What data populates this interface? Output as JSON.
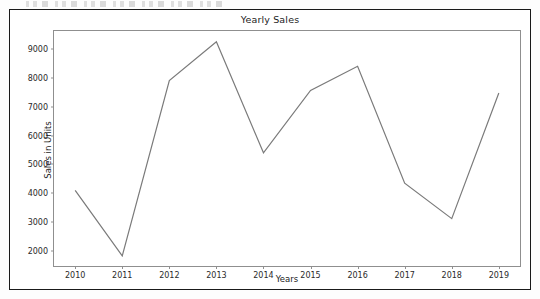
{
  "figure": {
    "title": "Yearly Sales",
    "background_color": "#ffffff",
    "frame_color": "#1a1a1a",
    "axes_color": "#8f8f8f",
    "line_color": "#7a7a7a"
  },
  "chart_data": {
    "type": "line",
    "title": "Yearly Sales",
    "xlabel": "Years",
    "ylabel": "Sales in Units",
    "x": [
      2010,
      2011,
      2012,
      2013,
      2014,
      2015,
      2016,
      2017,
      2018,
      2019
    ],
    "xtick_labels": [
      "2010",
      "2011",
      "2012",
      "2013",
      "2014",
      "2015",
      "2016",
      "2017",
      "2018",
      "2019"
    ],
    "ytick_labels": [
      "2000",
      "3000",
      "4000",
      "5000",
      "6000",
      "7000",
      "8000",
      "9000"
    ],
    "yticks": [
      2000,
      3000,
      4000,
      5000,
      6000,
      7000,
      8000,
      9000
    ],
    "values": [
      4100,
      1830,
      7900,
      9250,
      5400,
      7560,
      8400,
      4350,
      3120,
      7470
    ],
    "series": [
      {
        "name": "Sales in Units",
        "values": [
          4100,
          1830,
          7900,
          9250,
          5400,
          7560,
          8400,
          4350,
          3120,
          7470
        ],
        "color": "#7a7a7a"
      }
    ],
    "xlim": [
      2009.55,
      2019.45
    ],
    "ylim": [
      1480,
      9620
    ],
    "grid": false,
    "legend": false,
    "markers": false
  }
}
